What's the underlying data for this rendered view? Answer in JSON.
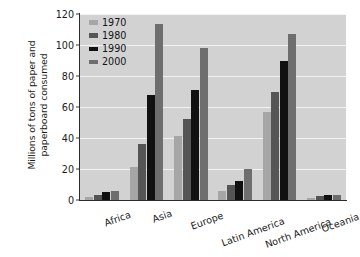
{
  "chart_data": {
    "type": "bar",
    "title": "",
    "xlabel": "",
    "ylabel": "Millions of tons of paper and paperboard consumed",
    "ylabel_line1": "Millions of tons of paper and",
    "ylabel_line2": "paperboard consumed",
    "ylim": [
      0,
      120
    ],
    "ytick_step": 20,
    "yticks": [
      0,
      20,
      40,
      60,
      80,
      100,
      120
    ],
    "grid": "horizontal",
    "legend_position": "top-left-inside",
    "categories": [
      "Africa",
      "Asia",
      "Europe",
      "Latin America",
      "North America",
      "Oceania"
    ],
    "series": [
      {
        "name": "1970",
        "color": "#a6a6a6",
        "values": [
          2,
          21,
          41.5,
          6,
          57,
          1.5
        ]
      },
      {
        "name": "1980",
        "color": "#555555",
        "values": [
          3,
          36,
          52,
          10,
          70,
          2.5
        ]
      },
      {
        "name": "1990",
        "color": "#111111",
        "values": [
          5,
          68,
          71,
          12,
          90,
          3
        ]
      },
      {
        "name": "2000",
        "color": "#6e6e6e",
        "values": [
          5.5,
          113.5,
          98,
          20,
          107,
          3.5
        ]
      }
    ],
    "plot_background": "#d2d2d2",
    "gridline_color": "#f2f2f2",
    "axis_color": "#2b2b2b",
    "figure_background": "#ffffff"
  }
}
